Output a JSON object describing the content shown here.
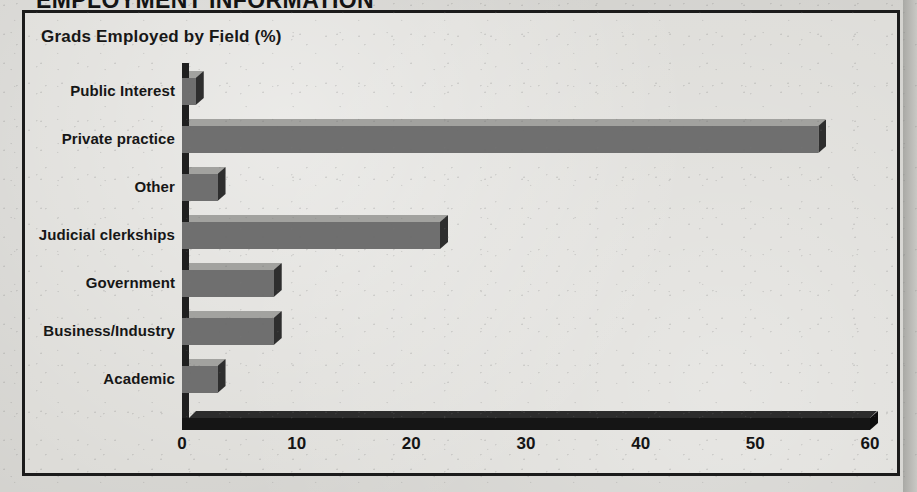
{
  "header": {
    "section_title": "EMPLOYMENT INFORMATION"
  },
  "chart": {
    "title": "Grads Employed by Field (%)"
  },
  "chart_data": {
    "type": "bar",
    "orientation": "horizontal",
    "title": "Grads Employed by Field (%)",
    "xlabel": "",
    "ylabel": "",
    "xlim": [
      0,
      60
    ],
    "xticks": [
      0,
      10,
      20,
      30,
      40,
      50,
      60
    ],
    "xtick_labels": [
      "0",
      "10",
      "20",
      "30",
      "40",
      "50",
      "60"
    ],
    "grid": false,
    "legend": false,
    "style": "3d-bar",
    "bar_color": "#6f6f6f",
    "bar_top_color": "#a2a29f",
    "bar_cap_color": "#2e2e2e",
    "categories": [
      "Public Interest",
      "Private practice",
      "Other",
      "Judicial clerkships",
      "Government",
      "Business/Industry",
      "Academic"
    ],
    "values": [
      1.2,
      55.5,
      3.1,
      22.5,
      8.0,
      8.0,
      3.1
    ]
  },
  "colors": {
    "frame": "#1b1b1b",
    "paper": "#dddcd8",
    "axis": "#151515",
    "text": "#161616"
  }
}
